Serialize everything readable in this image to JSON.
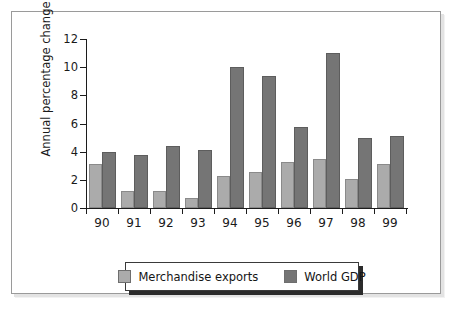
{
  "chart_data": {
    "type": "bar",
    "title": "",
    "xlabel": "",
    "ylabel": "Annual percentage change",
    "ylim": [
      0,
      12
    ],
    "yticks": [
      0,
      2,
      4,
      6,
      8,
      10,
      12
    ],
    "grid": false,
    "legend_position": "bottom-center",
    "categories": [
      "90",
      "91",
      "92",
      "93",
      "94",
      "95",
      "96",
      "97",
      "98",
      "99"
    ],
    "series": [
      {
        "name": "Merchandise exports",
        "color": "#ababab",
        "values": [
          3.1,
          1.2,
          1.2,
          0.7,
          2.3,
          2.55,
          3.25,
          3.5,
          2.05,
          3.1
        ]
      },
      {
        "name": "World GDP",
        "color": "#757575",
        "values": [
          4.0,
          3.75,
          4.4,
          4.15,
          10.0,
          9.35,
          5.75,
          11.0,
          4.95,
          5.1
        ]
      }
    ]
  }
}
